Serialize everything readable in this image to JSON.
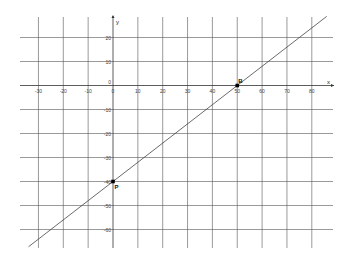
{
  "chart_data": {
    "type": "line",
    "title": "",
    "xlabel": "x",
    "ylabel": "y",
    "xlim": [
      -35,
      88
    ],
    "ylim": [
      -66,
      28
    ],
    "grid": true,
    "x_ticks": [
      -30,
      -20,
      -10,
      0,
      10,
      20,
      30,
      40,
      50,
      60,
      70,
      80
    ],
    "x_tick_labels": [
      "-30",
      "-20",
      "-10",
      "0",
      "10",
      "20",
      "30",
      "40",
      "50",
      "60",
      "70",
      "80"
    ],
    "y_ticks": [
      20,
      10,
      0,
      -10,
      -20,
      -30,
      -40,
      -50,
      -60
    ],
    "y_tick_labels": [
      "20",
      "10",
      "0",
      "-10",
      "-20",
      "-30",
      "-40",
      "-50",
      "-60"
    ],
    "series": [
      {
        "name": "line through P and B",
        "equation": "y = 0.8x - 40",
        "x": [
          -34,
          86
        ],
        "y": [
          -67.2,
          28.8
        ]
      }
    ],
    "points": [
      {
        "label": "B",
        "x": 50,
        "y": 0
      },
      {
        "label": "P",
        "x": 0,
        "y": -40
      }
    ],
    "colors": {
      "grid": "#555555",
      "line": "#444444",
      "point": "#000000"
    }
  },
  "axes": {
    "x_label": "x",
    "y_label": "y"
  },
  "points": {
    "B": "B",
    "P": "P"
  }
}
